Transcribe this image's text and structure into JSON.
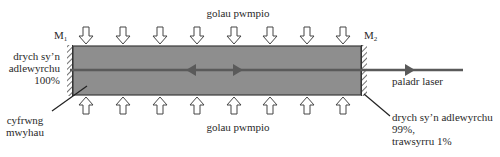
{
  "diagram": {
    "type": "laser-schematic",
    "colors": {
      "gain_medium_fill": "#8e8e8e",
      "gain_medium_border": "#3a3a3a",
      "beam": "#5a5a5a",
      "mirror": "#333333",
      "arrow_outline": "#444444"
    },
    "labels": {
      "pump_top": "golau pwmpio",
      "pump_bottom": "golau pwmpio",
      "mirror_left_id": "M",
      "mirror_left_sub": "1",
      "mirror_right_id": "M",
      "mirror_right_sub": "2",
      "mirror_left_desc_1": "drych sy’n",
      "mirror_left_desc_2": "adlewyrchu",
      "mirror_left_desc_3": "100%",
      "gain_medium_1": "cyfrwng",
      "gain_medium_2": "mwyhau",
      "laser_beam": "paladr laser",
      "mirror_right_desc_1": "drych sy’n adlewyrchu",
      "mirror_right_desc_2": "99%,",
      "mirror_right_desc_3": "trawsyrru 1%"
    },
    "pump_arrows": {
      "top_count": 8,
      "bottom_count": 8
    }
  }
}
